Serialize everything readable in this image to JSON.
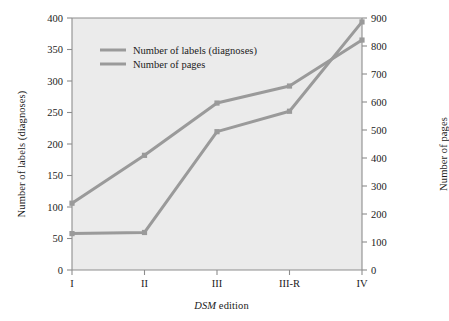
{
  "chart_data": {
    "type": "line",
    "title": "",
    "subtitle": "",
    "xlabel": "DSM edition",
    "xlabel_italic_part": "DSM",
    "xlabel_plain_part": " edition",
    "categories": [
      "I",
      "II",
      "III",
      "III-R",
      "IV"
    ],
    "grid": false,
    "legend_position": "top-left inside plot",
    "axes": {
      "left": {
        "label": "Number of labels (diagnoses)",
        "ticks": [
          0,
          50,
          100,
          150,
          200,
          250,
          300,
          350,
          400
        ],
        "lim": [
          0,
          400
        ]
      },
      "right": {
        "label": "Number of pages",
        "ticks": [
          0,
          100,
          200,
          300,
          400,
          500,
          600,
          700,
          800,
          900
        ],
        "lim": [
          0,
          900
        ]
      }
    },
    "series": [
      {
        "name": "Number of labels (diagnoses)",
        "axis": "left",
        "color": "#9a9a9a",
        "marker": "square",
        "values": [
          106,
          182,
          265,
          292,
          365
        ]
      },
      {
        "name": "Number of pages",
        "axis": "right",
        "color": "#9a9a9a",
        "marker": "square",
        "values": [
          130,
          134,
          494,
          567,
          886
        ]
      }
    ]
  },
  "legend": {
    "entries": [
      {
        "label": "Number of labels (diagnoses)"
      },
      {
        "label": "Number of pages"
      }
    ]
  },
  "style": {
    "plot_background": "#ebebeb",
    "page_background": "#ffffff",
    "axis_color": "#8d8d8d",
    "line_color": "#9a9a9a",
    "text_color": "#1b1b1b"
  }
}
